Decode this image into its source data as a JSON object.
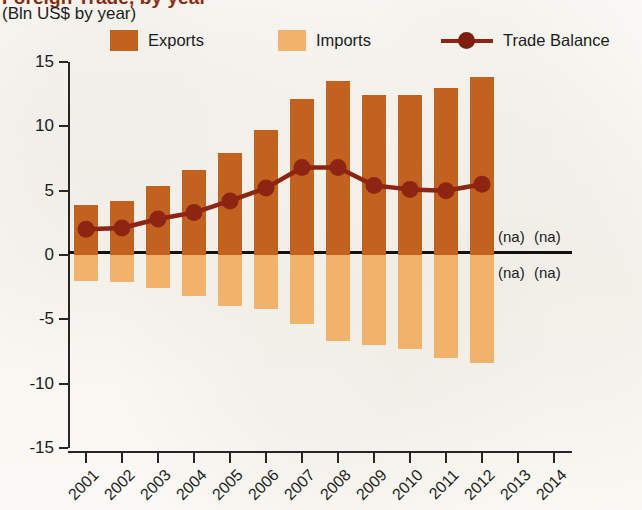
{
  "header": {
    "title": "Foreign Trade, by year",
    "subtitle": "(Bln US$ by year)"
  },
  "legend": {
    "items": [
      {
        "label": "Exports",
        "marker": "swatch",
        "color": "#c2621e"
      },
      {
        "label": "Imports",
        "marker": "swatch",
        "color": "#f1b36c"
      },
      {
        "label": "Trade Balance",
        "marker": "line-point",
        "color": "#8e2412"
      }
    ]
  },
  "annotations": {
    "na_text": "(na)",
    "na_cells": [
      {
        "year": "2013",
        "position": "above-zero"
      },
      {
        "year": "2014",
        "position": "above-zero"
      },
      {
        "year": "2013",
        "position": "below-zero"
      },
      {
        "year": "2014",
        "position": "below-zero"
      }
    ]
  },
  "chart_data": {
    "type": "bar",
    "title": "Foreign Trade, by year",
    "subtitle": "(Bln US$ by year)",
    "xlabel": "",
    "ylabel": "Bln US$",
    "ylim": [
      -15,
      15
    ],
    "yticks": [
      15,
      10,
      5,
      0,
      -5,
      -10,
      -15
    ],
    "ytick_labels": [
      "15",
      "10",
      "5",
      "0",
      "-5",
      "-10",
      "-15"
    ],
    "grid": false,
    "legend_position": "top",
    "categories": [
      "2001",
      "2002",
      "2003",
      "2004",
      "2005",
      "2006",
      "2007",
      "2008",
      "2009",
      "2010",
      "2011",
      "2012",
      "2013",
      "2014"
    ],
    "series": [
      {
        "name": "Exports",
        "type": "bar",
        "color": "#c2621e",
        "values": [
          3.9,
          4.2,
          5.4,
          6.6,
          7.9,
          9.7,
          12.1,
          13.5,
          12.4,
          12.4,
          13.0,
          13.8,
          null,
          null
        ]
      },
      {
        "name": "Imports",
        "type": "bar",
        "color": "#f1b36c",
        "values": [
          -2.0,
          -2.1,
          -2.6,
          -3.2,
          -4.0,
          -4.2,
          -5.4,
          -6.7,
          -7.0,
          -7.3,
          -8.0,
          -8.4,
          null,
          null
        ]
      },
      {
        "name": "Trade Balance",
        "type": "line",
        "color": "#8e2412",
        "values": [
          2.0,
          2.1,
          2.8,
          3.3,
          4.2,
          5.2,
          6.8,
          6.8,
          5.4,
          5.1,
          5.0,
          5.5,
          null,
          null
        ]
      }
    ],
    "missing_data_label": "(na)",
    "missing_years": [
      "2013",
      "2014"
    ]
  }
}
